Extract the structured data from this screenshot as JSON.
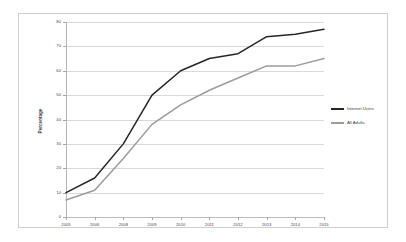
{
  "chart_data": {
    "type": "line",
    "title": "",
    "subtitle": "",
    "xlabel": "",
    "ylabel": "Percentage",
    "categories": [
      "2005",
      "2006",
      "2008",
      "2009",
      "2010",
      "2011",
      "2012",
      "2013",
      "2014",
      "2015"
    ],
    "ylim": [
      0,
      80
    ],
    "ytick_step": 10,
    "yticks": [
      "0",
      "10",
      "20",
      "30",
      "40",
      "50",
      "60",
      "70",
      "80"
    ],
    "grid": true,
    "legend_position": "right",
    "series": [
      {
        "name": "Internet Users",
        "color": "#262626",
        "values": [
          10,
          16,
          30,
          50,
          60,
          65,
          67,
          74,
          75,
          77
        ]
      },
      {
        "name": "All Adults",
        "color": "#9c9c9c",
        "values": [
          7,
          11,
          24,
          38,
          46,
          52,
          57,
          62,
          62,
          65
        ]
      }
    ]
  },
  "figure": {
    "border_color": "#cfcfcf",
    "background": "#ffffff"
  }
}
